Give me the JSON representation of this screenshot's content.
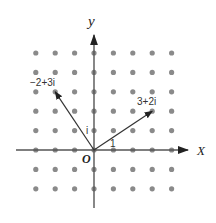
{
  "diagram": {
    "type": "complex-plane-lattice",
    "origin_px": [
      94,
      150
    ],
    "unit_px": 19.4,
    "grid": {
      "x_range": [
        -3,
        4
      ],
      "y_range": [
        -2,
        5
      ],
      "dot_color": "#8a8a8a"
    },
    "axes": {
      "x_label": "X",
      "y_label": "y",
      "origin_label": "O",
      "unit_real_label": "1",
      "unit_imag_label": "i",
      "color": "#555555"
    },
    "vectors": [
      {
        "label": "3+2i",
        "re": 3,
        "im": 2
      },
      {
        "label": "−2+3i",
        "re": -2,
        "im": 3
      }
    ]
  }
}
